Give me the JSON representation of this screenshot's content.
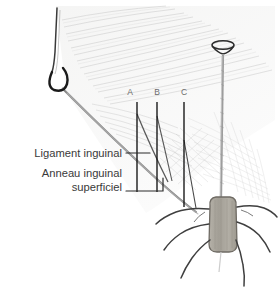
{
  "figure": {
    "background_color": "#ffffff",
    "width": 280,
    "height": 295,
    "line_color": "#1a1a1a",
    "sketch_color": "#9a9a9a",
    "text_color": "#3a3a3a",
    "cord_fill": "#a8a49c"
  },
  "labels": [
    {
      "id": "ligament-inguinal",
      "text": "Ligament inguinal",
      "x": 122,
      "y": 157,
      "align": "end"
    },
    {
      "id": "anneau-inguinal",
      "text": "Anneau inguinal",
      "x": 122,
      "y": 177,
      "align": "end"
    },
    {
      "id": "anneau-superficiel",
      "text": "superficiel",
      "x": 122,
      "y": 191,
      "align": "end"
    }
  ],
  "markers": [
    {
      "id": "marker-a",
      "letter": "A",
      "x": 130,
      "y": 95
    },
    {
      "id": "marker-b",
      "letter": "B",
      "x": 157,
      "y": 95
    },
    {
      "id": "marker-c",
      "letter": "C",
      "x": 184,
      "y": 95
    }
  ],
  "leader_lines": {
    "ligament_leader": "M126,153 L150,153",
    "anneau_leader": "M126,189 L163,189 L163,178",
    "marker_a_line": "M137,102 L137,192",
    "marker_b_line": "M157,102 L157,192",
    "marker_c_line": "M184,102 L184,207"
  },
  "structures": [
    {
      "id": "retractor-hook",
      "name": "retractor hook"
    },
    {
      "id": "inguinal-ligament-edge",
      "name": "inguinal ligament edge"
    },
    {
      "id": "external-oblique-aponeurosis",
      "name": "external oblique aponeurosis"
    },
    {
      "id": "spermatic-cord",
      "name": "spermatic cord"
    },
    {
      "id": "superficial-inguinal-ring",
      "name": "superficial inguinal ring"
    },
    {
      "id": "probe-instrument",
      "name": "probe instrument"
    }
  ]
}
